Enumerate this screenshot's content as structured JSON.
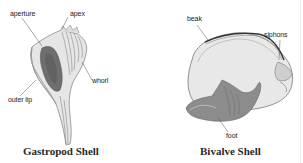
{
  "figure": {
    "panels": [
      {
        "id": "gastropod",
        "caption": "Gastropod Shell",
        "labels": {
          "aperture": "aperture",
          "apex": "apex",
          "whorl": "whorl",
          "outer_lip": "outer lip"
        }
      },
      {
        "id": "bivalve",
        "caption": "Bivalve Shell",
        "labels": {
          "beak": "beak",
          "siphons": "siphons",
          "foot": "foot"
        }
      }
    ]
  },
  "colors": {
    "background": "#ffffff",
    "label_text": "#222222",
    "shell_light": "#e4e4e4",
    "shell_dark": "#6e6e6e",
    "leader_line": "#555555"
  }
}
